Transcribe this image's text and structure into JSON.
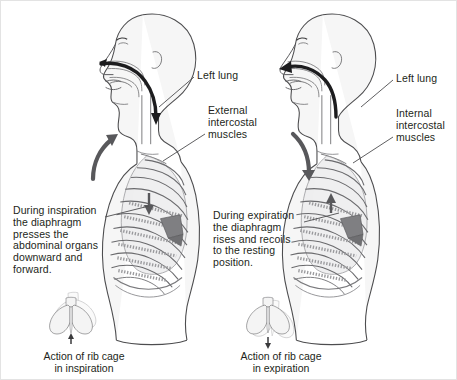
{
  "figure": {
    "background_color": "#ffffff",
    "border_color": "#e3e3e3",
    "ink_color": "#231f20",
    "line_color": "#58585b",
    "fill_color": "#f3f3f3",
    "muscle_fill": "#8a8a8d"
  },
  "panels": {
    "left": {
      "name": "inspiration",
      "labels": {
        "lung": "Left lung",
        "muscles": "External\nintercostal\nmuscles",
        "paragraph": "During inspiration\nthe diaphragm\npresses the\nabdominal organs\ndownward and\nforward."
      },
      "caption": "Action of rib cage\nin inspiration",
      "airflow": "in",
      "ribcage_arrow": "up"
    },
    "right": {
      "name": "expiration",
      "labels": {
        "lung": "Left lung",
        "muscles": "Internal\nintercostal\nmuscles",
        "paragraph": "During expiration\nthe diaphragm\nrises and recoils\nto the resting\nposition."
      },
      "caption": "Action of rib cage\nin expiration",
      "airflow": "out",
      "ribcage_arrow": "down"
    }
  }
}
